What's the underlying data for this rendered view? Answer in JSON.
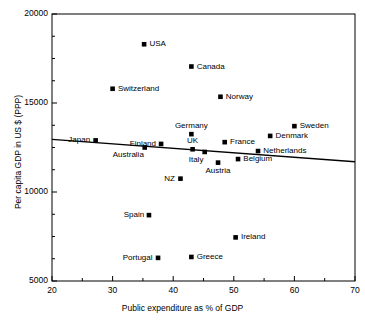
{
  "chart_data": {
    "type": "scatter",
    "title": "",
    "xlabel": "Public expenditure as % of GDP",
    "ylabel": "Per capita GDP in US $ (PPP)",
    "xlim": [
      20,
      70
    ],
    "ylim": [
      5000,
      20000
    ],
    "xticks": [
      20,
      30,
      40,
      50,
      60,
      70
    ],
    "xtick_labels": [
      "20",
      "30",
      "40",
      "50",
      "60",
      "70"
    ],
    "yticks": [
      5000,
      10000,
      15000,
      20000
    ],
    "ytick_labels": [
      "5000",
      "10000",
      "15000",
      "20000"
    ],
    "minor_xtick_step": 5,
    "minor_ytick_step": 1250,
    "grid": false,
    "legend": "none",
    "marker": "square",
    "marker_color": "#000000",
    "line_color": "#000000",
    "points": [
      {
        "name": "USA",
        "x": 35.2,
        "y": 18300,
        "label_pos": "right"
      },
      {
        "name": "Canada",
        "x": 43.0,
        "y": 17050,
        "label_pos": "right"
      },
      {
        "name": "Switzerland",
        "x": 30.0,
        "y": 15800,
        "label_pos": "right"
      },
      {
        "name": "Norway",
        "x": 47.8,
        "y": 15350,
        "label_pos": "right"
      },
      {
        "name": "Sweden",
        "x": 60.0,
        "y": 13700,
        "label_pos": "right"
      },
      {
        "name": "Germany",
        "x": 43.0,
        "y": 13250,
        "label_pos": "above"
      },
      {
        "name": "Denmark",
        "x": 56.0,
        "y": 13150,
        "label_pos": "right"
      },
      {
        "name": "Japan",
        "x": 27.2,
        "y": 12900,
        "label_pos": "left"
      },
      {
        "name": "France",
        "x": 48.5,
        "y": 12800,
        "label_pos": "right"
      },
      {
        "name": "Finland",
        "x": 38.0,
        "y": 12700,
        "label_pos": "left"
      },
      {
        "name": "Australia",
        "x": 35.3,
        "y": 12500,
        "label_pos": "below-left"
      },
      {
        "name": "UK",
        "x": 43.2,
        "y": 12400,
        "label_pos": "above"
      },
      {
        "name": "Netherlands",
        "x": 54.0,
        "y": 12300,
        "label_pos": "right"
      },
      {
        "name": "Italy",
        "x": 45.2,
        "y": 12250,
        "label_pos": "below-left"
      },
      {
        "name": "Belgium",
        "x": 50.7,
        "y": 11850,
        "label_pos": "right"
      },
      {
        "name": "Austria",
        "x": 47.4,
        "y": 11650,
        "label_pos": "below"
      },
      {
        "name": "NZ",
        "x": 41.2,
        "y": 10750,
        "label_pos": "left"
      },
      {
        "name": "Spain",
        "x": 36.0,
        "y": 8700,
        "label_pos": "left"
      },
      {
        "name": "Ireland",
        "x": 50.3,
        "y": 7450,
        "label_pos": "right"
      },
      {
        "name": "Greece",
        "x": 43.0,
        "y": 6350,
        "label_pos": "right"
      },
      {
        "name": "Portugal",
        "x": 37.5,
        "y": 6300,
        "label_pos": "left"
      }
    ],
    "trendline": {
      "x_start": 20,
      "y_start": 12960,
      "x_end": 70,
      "y_end": 11700
    }
  }
}
